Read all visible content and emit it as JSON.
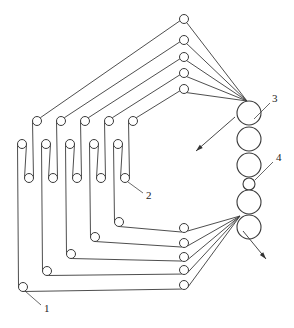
{
  "figure": {
    "width": 294,
    "height": 328,
    "line_color": "#3a3a3a",
    "background": "#ffffff"
  },
  "stack_rollers": [
    {
      "cx": 249,
      "cy": 113,
      "r": 12
    },
    {
      "cx": 249,
      "cy": 139,
      "r": 12
    },
    {
      "cx": 249,
      "cy": 165,
      "r": 12
    },
    {
      "cx": 249,
      "cy": 184,
      "r": 6
    },
    {
      "cx": 249,
      "cy": 202,
      "r": 12
    },
    {
      "cx": 249,
      "cy": 227,
      "r": 12
    }
  ],
  "convergence": {
    "top": {
      "x": 247,
      "y": 101
    },
    "bottom": {
      "x": 240,
      "y": 216
    }
  },
  "film_paths": [
    {
      "top_roller": {
        "cx": 184,
        "cy": 19
      },
      "upper": {
        "cx": 37,
        "cy": 121
      },
      "u": {
        "cx": 29,
        "cy": 178
      },
      "middle": {
        "cx": 22,
        "cy": 144
      },
      "corner": {
        "cx": 23,
        "cy": 287
      },
      "bottom_roller": {
        "cx": 184,
        "cy": 285
      }
    },
    {
      "top_roller": {
        "cx": 184,
        "cy": 40
      },
      "upper": {
        "cx": 61,
        "cy": 121
      },
      "u": {
        "cx": 53,
        "cy": 178
      },
      "middle": {
        "cx": 46,
        "cy": 144
      },
      "corner": {
        "cx": 47,
        "cy": 271
      },
      "bottom_roller": {
        "cx": 184,
        "cy": 270
      }
    },
    {
      "top_roller": {
        "cx": 184,
        "cy": 57
      },
      "upper": {
        "cx": 85,
        "cy": 121
      },
      "u": {
        "cx": 77,
        "cy": 178
      },
      "middle": {
        "cx": 70,
        "cy": 144
      },
      "corner": {
        "cx": 71,
        "cy": 254
      },
      "bottom_roller": {
        "cx": 184,
        "cy": 257
      }
    },
    {
      "top_roller": {
        "cx": 184,
        "cy": 73
      },
      "upper": {
        "cx": 109,
        "cy": 121
      },
      "u": {
        "cx": 101,
        "cy": 178
      },
      "middle": {
        "cx": 94,
        "cy": 144
      },
      "corner": {
        "cx": 95,
        "cy": 237
      },
      "bottom_roller": {
        "cx": 184,
        "cy": 243
      }
    },
    {
      "top_roller": {
        "cx": 184,
        "cy": 89
      },
      "upper": {
        "cx": 133,
        "cy": 121
      },
      "u": {
        "cx": 125,
        "cy": 178
      },
      "middle": {
        "cx": 118,
        "cy": 144
      },
      "corner": {
        "cx": 119,
        "cy": 222
      },
      "bottom_roller": {
        "cx": 184,
        "cy": 228
      }
    }
  ],
  "small_roller_radius": 4.5,
  "labels": [
    {
      "id": "label-1",
      "text": "1",
      "x": 44,
      "y": 312,
      "leader": [
        25,
        291,
        41,
        305
      ]
    },
    {
      "id": "label-2",
      "text": "2",
      "x": 146,
      "y": 199,
      "leader": [
        128,
        182,
        143,
        193
      ]
    },
    {
      "id": "label-3",
      "text": "3",
      "x": 272,
      "y": 102,
      "leader": [
        254,
        119,
        270,
        103
      ]
    },
    {
      "id": "label-4",
      "text": "4",
      "x": 276,
      "y": 161,
      "leader": [
        255,
        180,
        273,
        162
      ]
    }
  ],
  "arrows": [
    {
      "id": "arrow-out",
      "from": [
        235,
        117
      ],
      "to": [
        196,
        151
      ]
    },
    {
      "id": "arrow-in",
      "from": [
        243,
        231
      ],
      "to": [
        266,
        259
      ]
    }
  ]
}
